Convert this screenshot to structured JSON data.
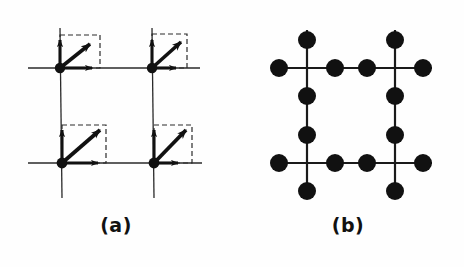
{
  "figure": {
    "title": "",
    "background_color": "#fefefe",
    "ink_color": "#111111",
    "panels": [
      {
        "id": "a",
        "caption": "(a)",
        "description": "square-lattice-with-displacement-arrows",
        "lattice": {
          "vertices": [
            {
              "name": "top-left",
              "x": 60,
              "y": 68
            },
            {
              "name": "top-right",
              "x": 152,
              "y": 68
            },
            {
              "name": "bottom-left",
              "x": 62,
              "y": 163
            },
            {
              "name": "bottom-right",
              "x": 154,
              "y": 163
            }
          ],
          "line_color": "#2a2a2a",
          "line_width": 1.3,
          "vertex_dot_radius": 5.2
        },
        "vector_sets": [
          {
            "vertex": "top-left",
            "up_arrow_length": 32,
            "right_arrow_length": 38,
            "diagonal_arrow_dx": 34,
            "diagonal_arrow_dy": -27,
            "dashed_box_w": 40,
            "dashed_box_h": 33
          },
          {
            "vertex": "top-right",
            "up_arrow_length": 32,
            "right_arrow_length": 28,
            "diagonal_arrow_dx": 32,
            "diagonal_arrow_dy": -30,
            "dashed_box_w": 35,
            "dashed_box_h": 34
          },
          {
            "vertex": "bottom-left",
            "up_arrow_length": 36,
            "right_arrow_length": 40,
            "diagonal_arrow_dx": 41,
            "diagonal_arrow_dy": -36,
            "dashed_box_w": 44,
            "dashed_box_h": 38
          },
          {
            "vertex": "bottom-right",
            "up_arrow_length": 36,
            "right_arrow_length": 28,
            "diagonal_arrow_dx": 34,
            "diagonal_arrow_dy": -36,
            "dashed_box_w": 38,
            "dashed_box_h": 38
          }
        ],
        "arrow_color": "#111111",
        "dashed_color": "#2a2a2a",
        "dash_pattern": "5,3"
      },
      {
        "id": "b",
        "caption": "(b)",
        "description": "square-lattice-with-four-satellite-dots-per-vertex",
        "lattice": {
          "vertices": [
            {
              "name": "top-left",
              "x": 75,
              "y": 68
            },
            {
              "name": "top-right",
              "x": 163,
              "y": 68
            },
            {
              "name": "bottom-left",
              "x": 75,
              "y": 163
            },
            {
              "name": "bottom-right",
              "x": 163,
              "y": 163
            }
          ],
          "line_color": "#1a1a1a",
          "line_width": 2.2
        },
        "dot_radius": 9,
        "dot_color": "#111111",
        "satellite_offset_x": 28,
        "satellite_offset_y": 28,
        "satellite_directions": [
          "left",
          "right",
          "up",
          "down"
        ],
        "dots_per_vertex": 4,
        "total_dots": 16
      }
    ]
  }
}
